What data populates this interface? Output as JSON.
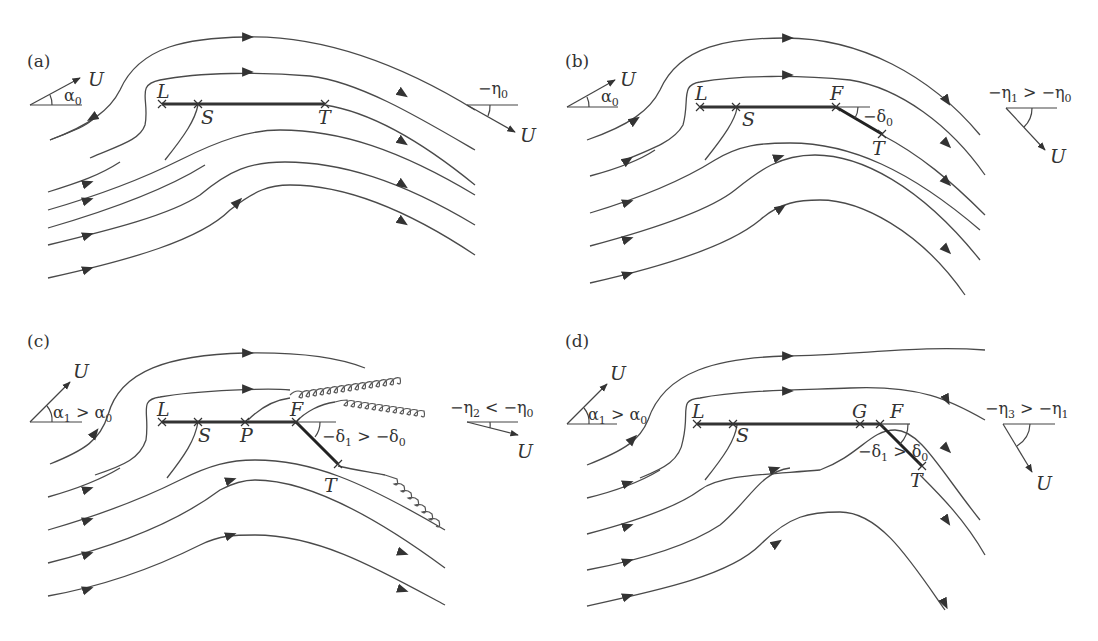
{
  "figure": {
    "colors": {
      "line": "#4a4a4a",
      "plate": "#333333",
      "background": "#ffffff"
    },
    "panels": [
      {
        "id": "a",
        "label": "(a)",
        "incidence": {
          "vector": "U",
          "angle": "α",
          "angle_sub": "0",
          "relation": ""
        },
        "points": [
          "L",
          "S",
          "T"
        ],
        "deflection": null,
        "exit_angle": {
          "text": "−η",
          "sub": "0",
          "rest": "",
          "vector": "U"
        },
        "wakes": false
      },
      {
        "id": "b",
        "label": "(b)",
        "incidence": {
          "vector": "U",
          "angle": "α",
          "angle_sub": "0",
          "relation": ""
        },
        "points": [
          "L",
          "S",
          "F",
          "T"
        ],
        "deflection": {
          "text": "−δ",
          "sub": "0",
          "rest": ""
        },
        "exit_angle": {
          "text": "−η",
          "sub": "1",
          "rest": " > −η",
          "rest_sub": "0",
          "vector": "U"
        },
        "wakes": false
      },
      {
        "id": "c",
        "label": "(c)",
        "incidence": {
          "vector": "U",
          "angle": "α",
          "angle_sub": "1",
          "relation": " > α",
          "relation_sub": "0"
        },
        "points": [
          "L",
          "S",
          "P",
          "F",
          "T"
        ],
        "deflection": {
          "text": "−δ",
          "sub": "1",
          "rest": " > −δ",
          "rest_sub": "0"
        },
        "exit_angle": {
          "text": "−η",
          "sub": "2",
          "rest": " < −η",
          "rest_sub": "0",
          "vector": "U"
        },
        "wakes": true
      },
      {
        "id": "d",
        "label": "(d)",
        "incidence": {
          "vector": "U",
          "angle": "α",
          "angle_sub": "1",
          "relation": " > α",
          "relation_sub": "0"
        },
        "points": [
          "L",
          "S",
          "G",
          "F",
          "T"
        ],
        "deflection": {
          "text": "−δ",
          "sub": "1",
          "rest": " > δ",
          "rest_sub": "0"
        },
        "exit_angle": {
          "text": "−η",
          "sub": "3",
          "rest": " > −η",
          "rest_sub": "1",
          "vector": "U"
        },
        "wakes": false
      }
    ]
  }
}
